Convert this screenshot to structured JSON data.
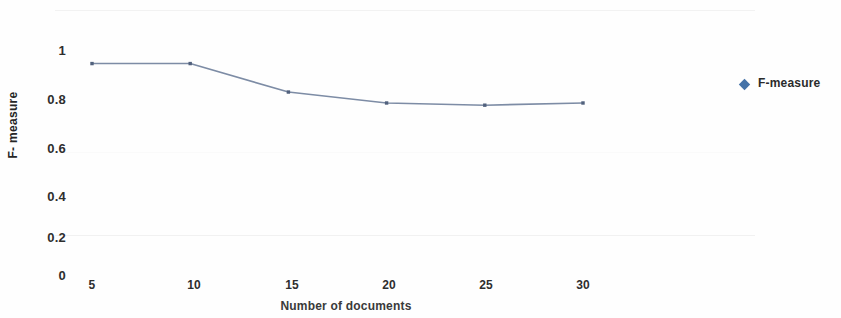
{
  "chart_data": {
    "type": "line",
    "title": "",
    "xlabel": "Number of documents",
    "ylabel": "F- measure",
    "x": [
      5,
      10,
      15,
      20,
      25,
      30
    ],
    "categories": [
      "5",
      "10",
      "15",
      "20",
      "25",
      "30"
    ],
    "series": [
      {
        "name": "F-measure",
        "values": [
          0.97,
          0.97,
          0.84,
          0.79,
          0.78,
          0.79
        ]
      }
    ],
    "xticks": [
      "5",
      "10",
      "15",
      "20",
      "25",
      "30"
    ],
    "yticks": [
      "0",
      "0.2",
      "0.4",
      "0.6",
      "0.8",
      "1"
    ],
    "ytick_values": [
      0,
      0.2,
      0.4,
      0.6,
      0.8,
      1
    ],
    "ylim": [
      0,
      1
    ],
    "xlim": [
      5,
      30
    ],
    "grid": false,
    "legend": {
      "position": "right",
      "entries": [
        {
          "label": "F-measure",
          "marker": "diamond",
          "color": "#4472a8"
        }
      ]
    },
    "colors": {
      "line": "#7d8ca5",
      "marker": "#51617d",
      "legend_marker": "#4472a8",
      "text": "#2e2e2e",
      "background": "#fefefe"
    }
  }
}
